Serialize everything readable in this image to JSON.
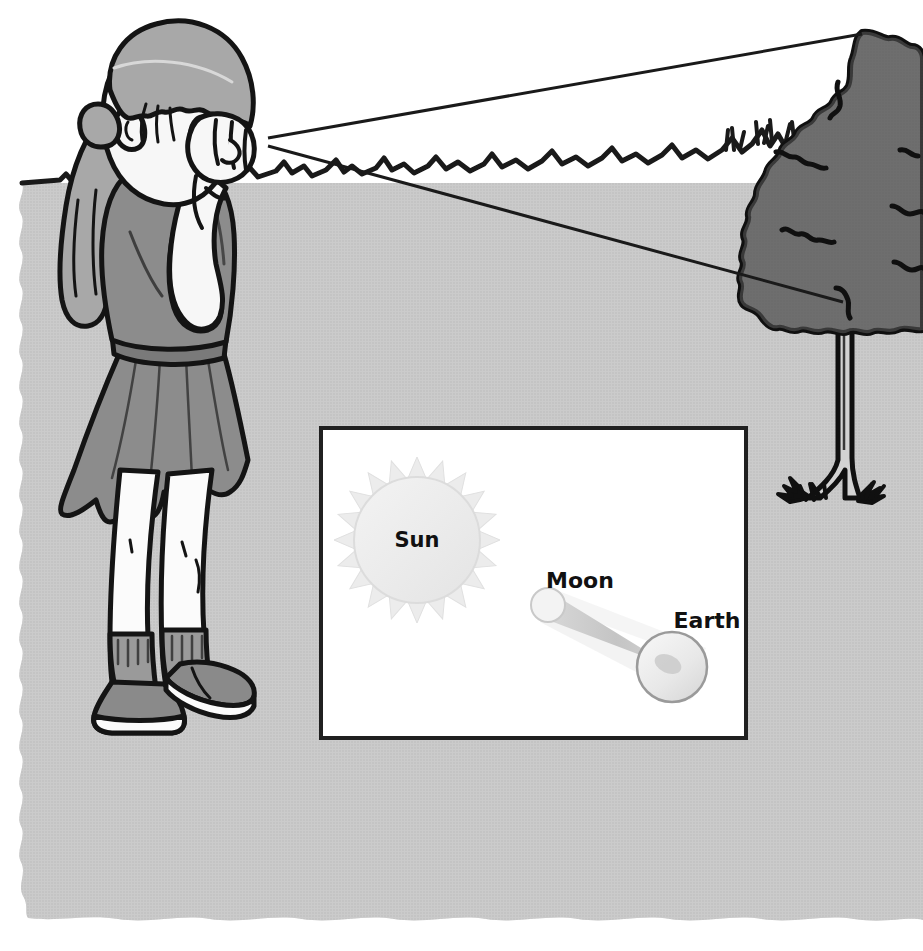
{
  "scene": {
    "title": "Girl observing a distant tree with a solar/lunar eclipse inset diagram",
    "width": 923,
    "height": 951,
    "sky_color": "#ffffff",
    "ground_color": "#b5b5b5",
    "grass_line_color": "#1a1a1a",
    "sightline_color": "#1a1a1a"
  },
  "figure": {
    "name": "girl-observer",
    "skin_color": "#f7f7f7",
    "hair_color": "#a8a8a8",
    "shirt_color": "#8c8c8c",
    "skirt_color": "#8c8c8c",
    "belt_color": "#7a7a7a",
    "shoe_color": "#8a8a8a",
    "sock_color": "#9a9a9a",
    "outline_color": "#141414"
  },
  "tree": {
    "name": "distant-tree",
    "canopy_color": "#6e6e6e",
    "trunk_color": "#d0d0d0",
    "outline_color": "#101010"
  },
  "sightlines": {
    "upper": {
      "name": "sightline-to-treetop",
      "from_x": 268,
      "from_y": 138,
      "to_x": 862,
      "to_y": 34
    },
    "lower": {
      "name": "sightline-to-treebase",
      "from_x": 268,
      "from_y": 146,
      "to_x": 843,
      "to_y": 302
    }
  },
  "diagram": {
    "name": "eclipse-inset-diagram",
    "box": {
      "x": 321,
      "y": 428,
      "width": 425,
      "height": 310
    },
    "background": "#ffffff",
    "border_color": "#202020",
    "border_width": 4,
    "bodies": [
      {
        "id": "sun",
        "label": "Sun",
        "label_x": 417,
        "label_y": 547,
        "cx": 417,
        "cy": 540,
        "radius": 63,
        "ray_count": 20,
        "ray_length": 20,
        "fill": "#ececec",
        "stroke": "#dcdcdc"
      },
      {
        "id": "moon",
        "label": "Moon",
        "label_x": 580,
        "label_y": 588,
        "cx": 548,
        "cy": 605,
        "radius": 17,
        "fill": "#f2f2f2",
        "stroke": "#cfcfcf"
      },
      {
        "id": "earth",
        "label": "Earth",
        "label_x": 707,
        "label_y": 628,
        "cx": 672,
        "cy": 667,
        "radius": 35,
        "fill": "#ededed",
        "stroke": "#9a9a9a"
      }
    ],
    "shadow": {
      "umbra_name": "umbra-cone",
      "penumbra_name": "penumbra-cone",
      "umbra_fill": "#c9c9c9",
      "penumbra_fill": "#f0f0f0"
    }
  },
  "labels": {
    "sun": "Sun",
    "moon": "Moon",
    "earth": "Earth"
  }
}
